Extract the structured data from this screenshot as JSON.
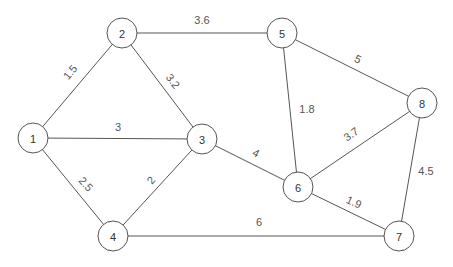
{
  "graph": {
    "type": "weighted-undirected-graph",
    "node_radius": 15,
    "colors": {
      "stroke": "#555555",
      "label": "#333333",
      "background": "#ffffff"
    },
    "nodes": [
      {
        "id": "1",
        "label": "1",
        "x": 33,
        "y": 138
      },
      {
        "id": "2",
        "label": "2",
        "x": 122,
        "y": 33
      },
      {
        "id": "3",
        "label": "3",
        "x": 202,
        "y": 139
      },
      {
        "id": "4",
        "label": "4",
        "x": 113,
        "y": 236
      },
      {
        "id": "5",
        "label": "5",
        "x": 282,
        "y": 33
      },
      {
        "id": "6",
        "label": "6",
        "x": 298,
        "y": 187
      },
      {
        "id": "7",
        "label": "7",
        "x": 399,
        "y": 236
      },
      {
        "id": "8",
        "label": "8",
        "x": 422,
        "y": 103
      }
    ],
    "edges": [
      {
        "from": "1",
        "to": "2",
        "weight": "1.5",
        "lx": 70,
        "ly": 72,
        "rot": -50
      },
      {
        "from": "1",
        "to": "3",
        "weight": "3",
        "lx": 118,
        "ly": 127,
        "rot": 0
      },
      {
        "from": "1",
        "to": "4",
        "weight": "2.5",
        "lx": 86,
        "ly": 184,
        "rot": 48
      },
      {
        "from": "2",
        "to": "3",
        "weight": "3.2",
        "lx": 173,
        "ly": 81,
        "rot": 52
      },
      {
        "from": "2",
        "to": "5",
        "weight": "3.6",
        "lx": 202,
        "ly": 20,
        "rot": 0
      },
      {
        "from": "3",
        "to": "4",
        "weight": "2",
        "lx": 151,
        "ly": 180,
        "rot": -50
      },
      {
        "from": "3",
        "to": "6",
        "weight": "4",
        "lx": 256,
        "ly": 153,
        "rot": 28
      },
      {
        "from": "4",
        "to": "7",
        "weight": "6",
        "lx": 259,
        "ly": 222,
        "rot": 0
      },
      {
        "from": "5",
        "to": "6",
        "weight": "1.8",
        "lx": 307,
        "ly": 109,
        "rot": 0
      },
      {
        "from": "5",
        "to": "8",
        "weight": "5",
        "lx": 358,
        "ly": 59,
        "rot": 25
      },
      {
        "from": "6",
        "to": "8",
        "weight": "3.7",
        "lx": 351,
        "ly": 134,
        "rot": -35
      },
      {
        "from": "6",
        "to": "7",
        "weight": "1.9",
        "lx": 354,
        "ly": 202,
        "rot": 25
      },
      {
        "from": "7",
        "to": "8",
        "weight": "4.5",
        "lx": 426,
        "ly": 171,
        "rot": 0
      }
    ]
  }
}
